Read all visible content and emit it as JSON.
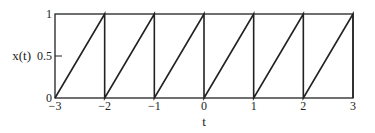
{
  "chart_data": {
    "type": "line",
    "title": "",
    "xlabel": "t",
    "ylabel": "x(t)",
    "xlim": [
      -3,
      3
    ],
    "ylim": [
      0,
      1
    ],
    "grid": false,
    "legend": null,
    "x_ticks": [
      -3,
      -2,
      -1,
      0,
      1,
      2,
      3
    ],
    "x_tick_labels": [
      "−3",
      "−2",
      "−1",
      "0",
      "1",
      "2",
      "3"
    ],
    "y_ticks": [
      0,
      0.5,
      1
    ],
    "y_tick_labels": [
      "0",
      "0.5",
      "1"
    ],
    "series": [
      {
        "name": "x(t) sawtooth",
        "description": "Periodic sawtooth, period 1: rises linearly from 0 to 1 on each interval [n, n+1], then drops vertically back to 0",
        "x": [
          -3,
          -2,
          -2,
          -1,
          -1,
          0,
          0,
          1,
          1,
          2,
          2,
          3,
          3
        ],
        "y": [
          0,
          1,
          0,
          1,
          0,
          1,
          0,
          1,
          0,
          1,
          0,
          1,
          0
        ]
      }
    ],
    "color": "#222222"
  }
}
